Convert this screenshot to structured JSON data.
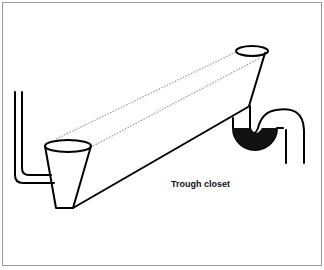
{
  "diagram": {
    "caption": "Trough closet",
    "parts": [
      "inlet-pipe",
      "inlet-funnel",
      "trough",
      "outlet-funnel",
      "water-trap",
      "outlet-pipe"
    ],
    "colors": {
      "line": "#000000",
      "water": "#111111",
      "dotted": "#999999"
    }
  }
}
